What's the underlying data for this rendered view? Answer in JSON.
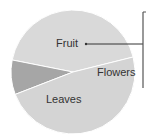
{
  "chart_data": {
    "type": "pie",
    "title": "",
    "categories": [
      "Fruit",
      "Flowers",
      "Leaves"
    ],
    "values": [
      43,
      9,
      48
    ],
    "units": "percent (estimated from slice angles)",
    "start_angle_deg": 14,
    "colors": {
      "Fruit": "#d9d9d9",
      "Flowers": "#a6a6a6",
      "Leaves": "#d4d4d4"
    },
    "annotations": [
      {
        "type": "leader-line",
        "from": "Fruit",
        "to": "bracket at right edge"
      }
    ],
    "legend": "none (labels inside slices)"
  },
  "labels": {
    "fruit": "Fruit",
    "flowers": "Flowers",
    "leaves": "Leaves"
  },
  "colors": {
    "separator": "#ffffff",
    "leader": "#333333",
    "bracket": "#555555"
  }
}
